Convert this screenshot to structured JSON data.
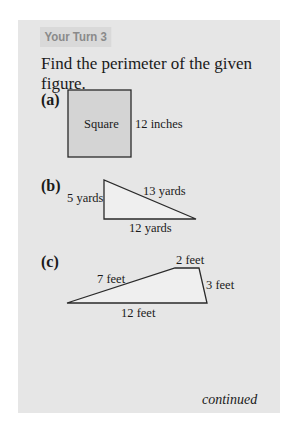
{
  "header": {
    "tag": "Your Turn 3"
  },
  "prompt": "Find the perimeter of the given figure.",
  "problems": [
    {
      "label": "(a)",
      "shape": "Square",
      "shape_label": "Square",
      "side_labels": [
        "12 inches"
      ]
    },
    {
      "label": "(b)",
      "shape": "Right triangle",
      "side_labels": [
        "5 yards",
        "13 yards",
        "12 yards"
      ]
    },
    {
      "label": "(c)",
      "shape": "Trapezoid",
      "side_labels": [
        "2 feet",
        "7 feet",
        "3 feet",
        "12 feet"
      ]
    }
  ],
  "footer": {
    "continued": "continued"
  },
  "colors": {
    "panel": "#e6e6e6",
    "tag_bg": "#d9d9d9",
    "tag_text": "#8a8a8a",
    "square_fill": "#d4d4d4",
    "stroke": "#2a2a2a"
  }
}
